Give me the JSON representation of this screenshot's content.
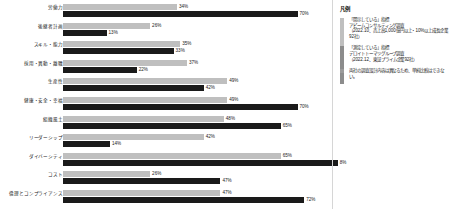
{
  "chart_data": {
    "type": "bar",
    "orientation": "horizontal",
    "grouped": true,
    "title": "",
    "xlabel": "",
    "ylabel": "",
    "xlim": [
      0,
      82
    ],
    "grid": false,
    "legend_position": "right",
    "categories": [
      "労働力",
      "後継者計画",
      "スキル・能力",
      "採用・異動・離職",
      "生産性",
      "健康・安全・幸福",
      "組織風土",
      "リーダーシップ",
      "ダイバーシティ",
      "コスト",
      "倫理とコンプライアンス"
    ],
    "series": [
      {
        "name": "「開示している」指標",
        "color": "#bfbfbf",
        "values": [
          34,
          26,
          35,
          37,
          49,
          49,
          48,
          42,
          65,
          26,
          47
        ]
      },
      {
        "name": "「測定している」指標",
        "color": "#1a1a1a",
        "values": [
          70,
          13,
          33,
          22,
          42,
          70,
          65,
          14,
          82,
          47,
          72
        ]
      }
    ],
    "value_labels": [
      {
        "light": "34%",
        "dark": "70%"
      },
      {
        "light": "26%",
        "dark": "13%"
      },
      {
        "light": "35%",
        "dark": "33%"
      },
      {
        "light": "37%",
        "dark": "22%"
      },
      {
        "light": "49%",
        "dark": "42%"
      },
      {
        "light": "49%",
        "dark": "70%"
      },
      {
        "light": "48%",
        "dark": "65%"
      },
      {
        "light": "42%",
        "dark": "14%"
      },
      {
        "light": "65%",
        "dark": "8%"
      },
      {
        "light": "26%",
        "dark": "47%"
      },
      {
        "light": "47%",
        "dark": "72%"
      }
    ]
  },
  "legend": {
    "title": "凡例",
    "items": [
      {
        "swatch": "light",
        "text": "「開示している」指標\nアビームコンサルティング調査\n（2022.10、売上高1,000億円以上・10%以上成長企業92社）"
      },
      {
        "swatch": "dark",
        "text": "「測定している」指標\nデロイトトーマツグループ調査\n（2022.12、東証プライム企業92社）"
      },
      {
        "swatch": "note",
        "text": "両社の調査設計内容は異なるため、単純比較はできない。"
      }
    ]
  }
}
